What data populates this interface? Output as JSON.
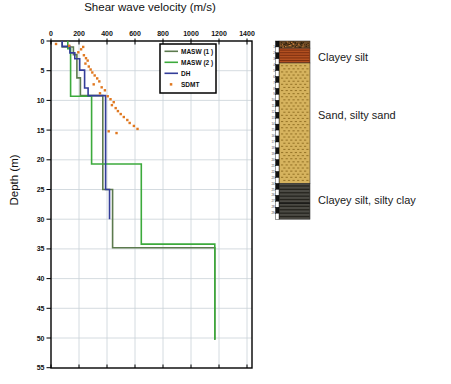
{
  "chart_data": {
    "type": "line",
    "title": "Shear wave velocity (m/s)",
    "xlabel": "Shear wave velocity (m/s)",
    "ylabel": "Depth (m)",
    "xlim": [
      0,
      1400
    ],
    "ylim": [
      55,
      0
    ],
    "x_ticks": [
      0,
      200,
      400,
      600,
      800,
      1000,
      1200,
      1400
    ],
    "y_ticks": [
      0,
      5,
      10,
      15,
      20,
      25,
      30,
      35,
      40,
      45,
      50,
      55
    ],
    "grid": true,
    "legend_position": "upper-right-inside",
    "series": [
      {
        "name": "MASW (1 )",
        "color": "#5c7a4e",
        "style": "line",
        "points_vs_depth": [
          [
            80,
            0
          ],
          [
            80,
            1
          ],
          [
            160,
            1
          ],
          [
            160,
            2.3
          ],
          [
            185,
            2.3
          ],
          [
            185,
            6.2
          ],
          [
            210,
            6.2
          ],
          [
            210,
            9.2
          ],
          [
            370,
            9.2
          ],
          [
            370,
            25
          ],
          [
            440,
            25
          ],
          [
            440,
            34.8
          ],
          [
            1170,
            34.8
          ],
          [
            1170,
            50.3
          ]
        ]
      },
      {
        "name": "MASW (2 )",
        "color": "#3caa3c",
        "style": "line",
        "points_vs_depth": [
          [
            120,
            0
          ],
          [
            120,
            1.3
          ],
          [
            140,
            1.3
          ],
          [
            140,
            9.3
          ],
          [
            290,
            9.3
          ],
          [
            290,
            20.7
          ],
          [
            645,
            20.7
          ],
          [
            645,
            34.2
          ],
          [
            1170,
            34.2
          ],
          [
            1170,
            50.3
          ]
        ]
      },
      {
        "name": "DH",
        "color": "#333d99",
        "style": "line",
        "points_vs_depth": [
          [
            80,
            0
          ],
          [
            80,
            0.9
          ],
          [
            135,
            0.9
          ],
          [
            135,
            2
          ],
          [
            170,
            2
          ],
          [
            170,
            3
          ],
          [
            205,
            3
          ],
          [
            205,
            4.9
          ],
          [
            240,
            4.9
          ],
          [
            240,
            7.9
          ],
          [
            265,
            7.9
          ],
          [
            265,
            9.2
          ],
          [
            390,
            9.2
          ],
          [
            390,
            25
          ],
          [
            418,
            25
          ],
          [
            418,
            30
          ]
        ]
      },
      {
        "name": "SDMT",
        "color": "#e07820",
        "style": "scatter",
        "points_vs_depth": [
          [
            36,
            0.5
          ],
          [
            130,
            0.8
          ],
          [
            230,
            1.0
          ],
          [
            215,
            1.4
          ],
          [
            195,
            1.9
          ],
          [
            235,
            2.4
          ],
          [
            250,
            2.9
          ],
          [
            262,
            3.3
          ],
          [
            246,
            3.8
          ],
          [
            270,
            4.3
          ],
          [
            283,
            4.8
          ],
          [
            295,
            5.3
          ],
          [
            312,
            5.8
          ],
          [
            330,
            6.3
          ],
          [
            345,
            6.8
          ],
          [
            305,
            7.3
          ],
          [
            362,
            7.8
          ],
          [
            385,
            8.3
          ],
          [
            350,
            8.8
          ],
          [
            405,
            9.3
          ],
          [
            425,
            9.8
          ],
          [
            448,
            10.3
          ],
          [
            435,
            10.8
          ],
          [
            462,
            11.3
          ],
          [
            478,
            11.8
          ],
          [
            498,
            12.3
          ],
          [
            520,
            12.8
          ],
          [
            545,
            13.3
          ],
          [
            562,
            13.8
          ],
          [
            592,
            14.3
          ],
          [
            618,
            14.8
          ],
          [
            412,
            15.2
          ],
          [
            468,
            15.5
          ]
        ]
      }
    ]
  },
  "soil_column": {
    "depth_top": 0,
    "depth_bottom": 30,
    "depth_marks": [
      1,
      2,
      3,
      4,
      5,
      6,
      7,
      8,
      9,
      10,
      11,
      12,
      13,
      14,
      15,
      16,
      17,
      18,
      19,
      20,
      21,
      22,
      23,
      24,
      25,
      26,
      27,
      28,
      29
    ],
    "layers": [
      {
        "name": "topsoil-fill",
        "from": 0,
        "to": 1.2,
        "color": "#6b4a26",
        "pattern": "speckle"
      },
      {
        "name": "clayey-silt",
        "from": 1.2,
        "to": 3.7,
        "color": "#b35020",
        "pattern": "hlines"
      },
      {
        "name": "sand-silty-sand",
        "from": 3.7,
        "to": 24,
        "color": "#d6b35e",
        "pattern": "dashes"
      },
      {
        "name": "clayey-silt-silty-clay",
        "from": 24,
        "to": 30,
        "color": "#4b4a44",
        "pattern": "hlines-dark"
      }
    ],
    "annotations": [
      {
        "text": "Clayey silt",
        "depth": 2.8
      },
      {
        "text": "Sand, silty sand",
        "depth": 12.5
      },
      {
        "text": "Clayey silt, silty clay",
        "depth": 27
      }
    ]
  }
}
